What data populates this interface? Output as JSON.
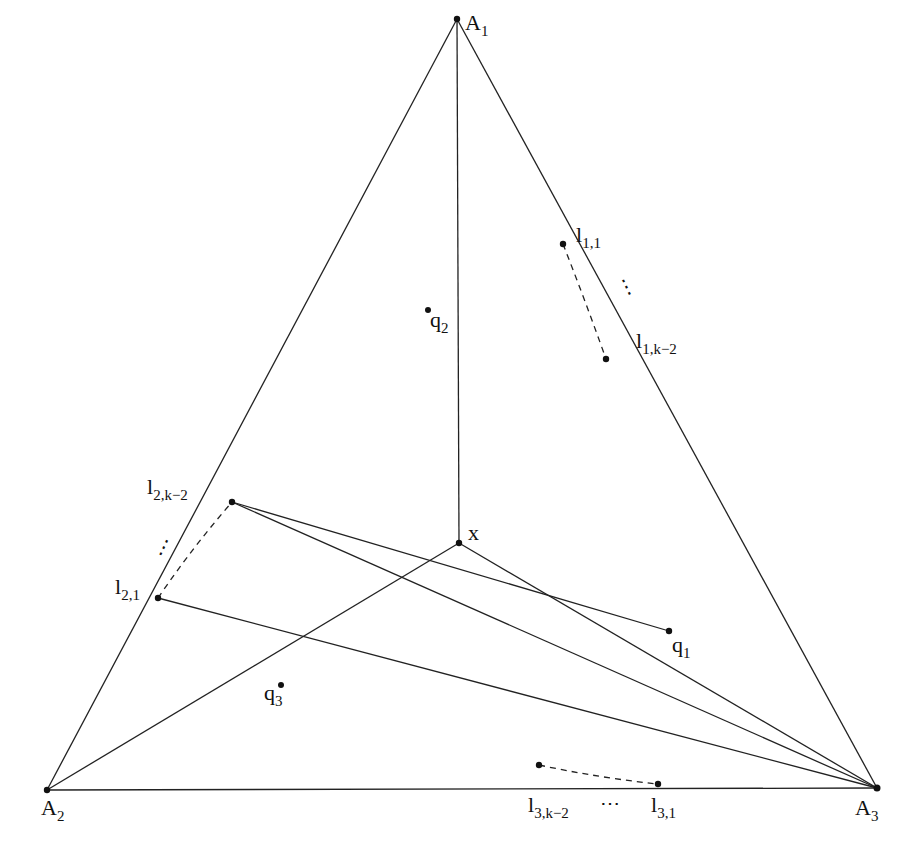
{
  "figure": {
    "type": "geometric-diagram",
    "stroke_color": "#222222",
    "background": "#ffffff"
  },
  "points": {
    "A1": {
      "base": "A",
      "sub": "1"
    },
    "A2": {
      "base": "A",
      "sub": "2"
    },
    "A3": {
      "base": "A",
      "sub": "3"
    },
    "x": {
      "base": "x",
      "sub": ""
    },
    "q1": {
      "base": "q",
      "sub": "1"
    },
    "q2": {
      "base": "q",
      "sub": "2"
    },
    "q3": {
      "base": "q",
      "sub": "3"
    },
    "l11": {
      "base": "l",
      "sub": "1,1"
    },
    "l1k2": {
      "base": "l",
      "sub": "1,k−2"
    },
    "l21": {
      "base": "l",
      "sub": "2,1"
    },
    "l2k2": {
      "base": "l",
      "sub": "2,k−2"
    },
    "l31": {
      "base": "l",
      "sub": "3,1"
    },
    "l3k2": {
      "base": "l",
      "sub": "3,k−2"
    }
  },
  "ellipses": {
    "side1": "⋮",
    "side2": "⋮",
    "side3": "⋯"
  },
  "segments": [
    {
      "from": "A1",
      "to": "A2",
      "style": "solid"
    },
    {
      "from": "A1",
      "to": "A3",
      "style": "solid"
    },
    {
      "from": "A2",
      "to": "A3",
      "style": "solid"
    },
    {
      "from": "A1",
      "to": "x",
      "style": "solid"
    },
    {
      "from": "A2",
      "to": "x",
      "style": "solid"
    },
    {
      "from": "A3",
      "to": "x",
      "style": "solid"
    },
    {
      "from": "l2k2",
      "to": "q1",
      "style": "solid"
    },
    {
      "from": "l2k2",
      "to": "A3",
      "style": "solid"
    },
    {
      "from": "l21",
      "to": "A3",
      "style": "solid"
    },
    {
      "from": "l11",
      "to": "l1k2",
      "style": "dashed"
    },
    {
      "from": "l21",
      "to": "l2k2",
      "style": "dashed"
    },
    {
      "from": "l3k2",
      "to": "l31",
      "style": "dashed"
    }
  ]
}
